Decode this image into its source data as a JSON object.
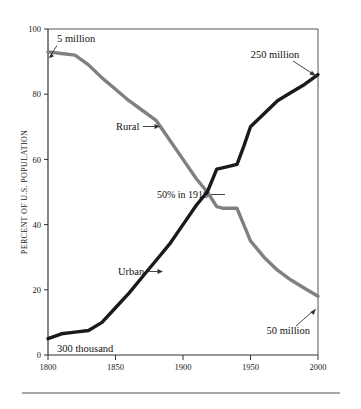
{
  "chart_data": {
    "type": "line",
    "title": "",
    "xlabel": "",
    "ylabel": "PERCENT OF U.S. POPULATION",
    "xlim": [
      1800,
      2000
    ],
    "ylim": [
      0,
      100
    ],
    "grid": false,
    "legend_position": "inline-labels",
    "x_ticks": [
      "1800",
      "1850",
      "1900",
      "1950",
      "2000"
    ],
    "x_tick_values": [
      1800,
      1850,
      1900,
      1950,
      2000
    ],
    "y_ticks": [
      "0",
      "20",
      "40",
      "60",
      "80",
      "100"
    ],
    "y_tick_values": [
      0,
      20,
      40,
      60,
      80,
      100
    ],
    "series": [
      {
        "name": "Rural",
        "color": "#808080",
        "x": [
          1800,
          1810,
          1820,
          1830,
          1840,
          1850,
          1860,
          1870,
          1880,
          1890,
          1900,
          1910,
          1918,
          1925,
          1930,
          1940,
          1945,
          1950,
          1960,
          1970,
          1980,
          1990,
          2000
        ],
        "values": [
          93,
          92.5,
          92,
          89,
          85,
          81.5,
          78,
          75,
          72,
          66,
          60,
          54,
          50,
          45.5,
          45,
          45,
          40,
          35,
          30,
          26,
          23,
          20.5,
          18
        ]
      },
      {
        "name": "Urban",
        "color": "#1a1a1a",
        "x": [
          1800,
          1810,
          1820,
          1830,
          1840,
          1850,
          1860,
          1870,
          1880,
          1890,
          1900,
          1910,
          1918,
          1925,
          1930,
          1940,
          1945,
          1950,
          1960,
          1970,
          1980,
          1990,
          2000
        ],
        "values": [
          5,
          6.5,
          7,
          7.5,
          10,
          14.5,
          19,
          24,
          29,
          34,
          40,
          46,
          50,
          57,
          57.5,
          58.5,
          64,
          70,
          74,
          78,
          80.5,
          83,
          86
        ]
      }
    ],
    "annotations": [
      {
        "id": "start-rural",
        "text": "5 million",
        "x": 1800,
        "y": 93,
        "placement": "above-right-with-arrow"
      },
      {
        "id": "end-urban",
        "text": "250 million",
        "x": 2000,
        "y": 86,
        "placement": "above-left-with-arrow"
      },
      {
        "id": "start-urban",
        "text": "300 thousand",
        "x": 1800,
        "y": 5,
        "placement": "below-right"
      },
      {
        "id": "end-rural",
        "text": "50 million",
        "x": 2000,
        "y": 18,
        "placement": "below-left-with-arrow"
      },
      {
        "id": "crossover",
        "text": "50% in 1918",
        "x": 1918,
        "y": 50,
        "placement": "left-with-leader"
      },
      {
        "id": "rural-series-label",
        "text": "Rural",
        "x": 1877,
        "y": 72,
        "placement": "left-with-arrow"
      },
      {
        "id": "urban-series-label",
        "text": "Urban",
        "x": 1880,
        "y": 29,
        "placement": "left-with-arrow"
      }
    ]
  },
  "figure": {
    "caption_rule": "horizontal-rule-below-plot"
  }
}
